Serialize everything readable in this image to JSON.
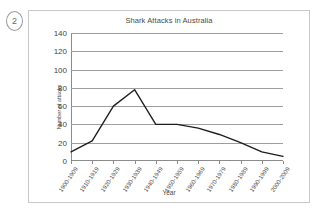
{
  "question_number": "2",
  "chart_data": {
    "type": "line",
    "title": "Shark Attacks in Australia",
    "xlabel": "Year",
    "ylabel": "Number of attacks",
    "categories": [
      "1900-1909",
      "1910-1919",
      "1920-1929",
      "1930-1939",
      "1940-1949",
      "1950-1959",
      "1960-1969",
      "1970-1979",
      "1980-1989",
      "1990-1999",
      "2000-2009"
    ],
    "values": [
      10,
      22,
      60,
      78,
      40,
      40,
      36,
      29,
      20,
      10,
      5
    ],
    "ylim": [
      0,
      140
    ],
    "yticks": [
      0,
      20,
      40,
      60,
      80,
      100,
      120,
      140
    ],
    "ytick_labels": [
      "0",
      "20",
      "40",
      "60",
      "80",
      "100",
      "120",
      "140"
    ],
    "grid": true,
    "legend": "none",
    "line_color": "#1d1d1d"
  }
}
